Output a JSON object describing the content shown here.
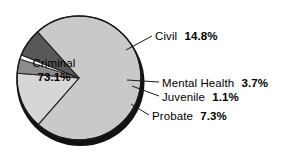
{
  "chart_data": {
    "type": "pie",
    "title": "",
    "subtitle": "",
    "xlabel": "",
    "ylabel": "",
    "legend_position": "none",
    "grid": false,
    "categories": [
      "Criminal",
      "Civil",
      "Probate",
      "Mental Health",
      "Juvenile"
    ],
    "values": [
      73.1,
      14.8,
      7.3,
      3.7,
      1.1
    ],
    "unit": "%",
    "slices": [
      {
        "label": "Criminal",
        "value": 73.1,
        "value_text": "73.1%",
        "color": "#c9c9c9",
        "label_placement": "inside"
      },
      {
        "label": "Civil",
        "value": 14.8,
        "value_text": "14.8%",
        "color": "#d6d6d6",
        "label_placement": "outside-right"
      },
      {
        "label": "Mental Health",
        "value": 3.7,
        "value_text": "3.7%",
        "color": "#8c8c8c",
        "label_placement": "outside-right"
      },
      {
        "label": "Juvenile",
        "value": 1.1,
        "value_text": "1.1%",
        "color": "#fbfbfb",
        "label_placement": "outside-right"
      },
      {
        "label": "Probate",
        "value": 7.3,
        "value_text": "7.3%",
        "color": "#585858",
        "label_placement": "outside-right"
      }
    ],
    "colors": {
      "background": "#ffffff",
      "outline": "#1a1a1a",
      "shadow_rim": "#111111",
      "text": "#000000"
    }
  }
}
